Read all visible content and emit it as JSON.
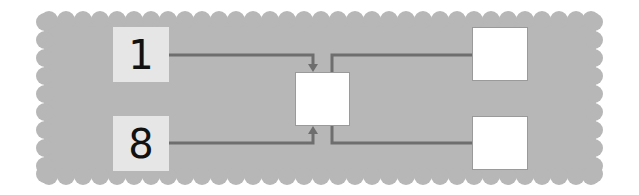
{
  "diagram": {
    "type": "number-combination-flow",
    "panel": {
      "shape": "scalloped-rectangle",
      "color": "#b7b7b7"
    },
    "connector_color": "#6e6e6e",
    "inputs": [
      {
        "id": "input-top",
        "value": "1"
      },
      {
        "id": "input-bottom",
        "value": "8"
      }
    ],
    "center_box": {
      "id": "center",
      "value": ""
    },
    "outputs": [
      {
        "id": "output-top",
        "value": ""
      },
      {
        "id": "output-bottom",
        "value": ""
      }
    ]
  }
}
